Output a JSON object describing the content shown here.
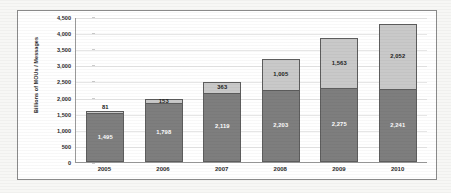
{
  "chart_data": {
    "type": "bar",
    "subtype": "stacked-bar",
    "title": "",
    "xlabel": "",
    "ylabel": "Billions of MOUs / Messages",
    "categories": [
      "2005",
      "2006",
      "2007",
      "2008",
      "2009",
      "2010"
    ],
    "series": [
      {
        "name": "MOUs",
        "color": "#7e7e7e",
        "values": [
          1495,
          1798,
          2119,
          2203,
          2275,
          2241
        ],
        "labels": [
          "1,495",
          "1,798",
          "2,119",
          "2,203",
          "2,275",
          "2,241"
        ],
        "label_position": "inside"
      },
      {
        "name": "Messages",
        "color": "#c9c9c9",
        "values": [
          81,
          153,
          363,
          1005,
          1563,
          2052
        ],
        "labels": [
          "81",
          "153",
          "363",
          "1,005",
          "1,563",
          "2,052"
        ],
        "label_position": [
          "above",
          "inside",
          "inside",
          "inside",
          "inside",
          "inside"
        ]
      }
    ],
    "totals": [
      1576,
      1951,
      2482,
      3208,
      3838,
      4293
    ],
    "ylim": [
      0,
      4500
    ],
    "ytick_step": 500,
    "ytick_labels": [
      "0",
      "500",
      "1,000",
      "1,500",
      "2,000",
      "2,500",
      "3,000",
      "3,500",
      "4,000",
      "4,500"
    ],
    "ytick_values": [
      0,
      500,
      1000,
      1500,
      2000,
      2500,
      3000,
      3500,
      4000,
      4500
    ],
    "grid": true,
    "legend": false,
    "legend_position": "none",
    "border": true
  },
  "axis": {
    "y_title": "Billions of MOUs / Messages"
  }
}
